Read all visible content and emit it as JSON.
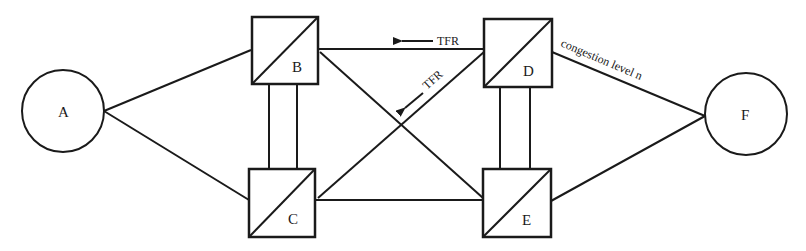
{
  "diagram": {
    "type": "network-topology",
    "stroke_color": "#1a1a1a",
    "background": "#ffffff",
    "nodes": [
      {
        "id": "A",
        "label": "A",
        "shape": "circle"
      },
      {
        "id": "B",
        "label": "B",
        "shape": "switch-box"
      },
      {
        "id": "C",
        "label": "C",
        "shape": "switch-box"
      },
      {
        "id": "D",
        "label": "D",
        "shape": "switch-box"
      },
      {
        "id": "E",
        "label": "E",
        "shape": "switch-box"
      },
      {
        "id": "F",
        "label": "F",
        "shape": "circle"
      }
    ],
    "edges": [
      {
        "from": "A",
        "to": "B"
      },
      {
        "from": "A",
        "to": "C"
      },
      {
        "from": "B",
        "to": "C",
        "style": "double"
      },
      {
        "from": "B",
        "to": "D"
      },
      {
        "from": "B",
        "to": "E"
      },
      {
        "from": "C",
        "to": "D"
      },
      {
        "from": "C",
        "to": "E"
      },
      {
        "from": "D",
        "to": "E",
        "style": "double"
      },
      {
        "from": "D",
        "to": "F",
        "label": "congestion level n"
      },
      {
        "from": "E",
        "to": "F"
      }
    ],
    "annotations": {
      "tfr_horizontal": "TFR",
      "tfr_diagonal": "TFR",
      "congestion": "congestion level n"
    }
  }
}
